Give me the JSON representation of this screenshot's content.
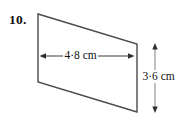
{
  "figure": {
    "question_number": "10.",
    "shape": "parallelogram",
    "stroke_color": "#4a4a4a",
    "background_color": "#ffffff",
    "text_color": "#121212",
    "dimensions": {
      "width_label": "4·8 cm",
      "width_value": 4.8,
      "height_label": "3·6 cm",
      "height_value": 3.6,
      "unit": "cm"
    },
    "vertices": {
      "top_left": [
        38,
        14
      ],
      "top_right": [
        137,
        44
      ],
      "bottom_right": [
        137,
        112
      ],
      "bottom_left": [
        38,
        82
      ]
    },
    "width_dimension_line": {
      "from": [
        40,
        56
      ],
      "to": [
        134,
        56
      ],
      "orientation": "horizontal",
      "arrowheads": "both"
    },
    "height_dimension_line": {
      "from": [
        155,
        44
      ],
      "to": [
        155,
        112
      ],
      "orientation": "vertical",
      "arrowheads": "both"
    }
  }
}
